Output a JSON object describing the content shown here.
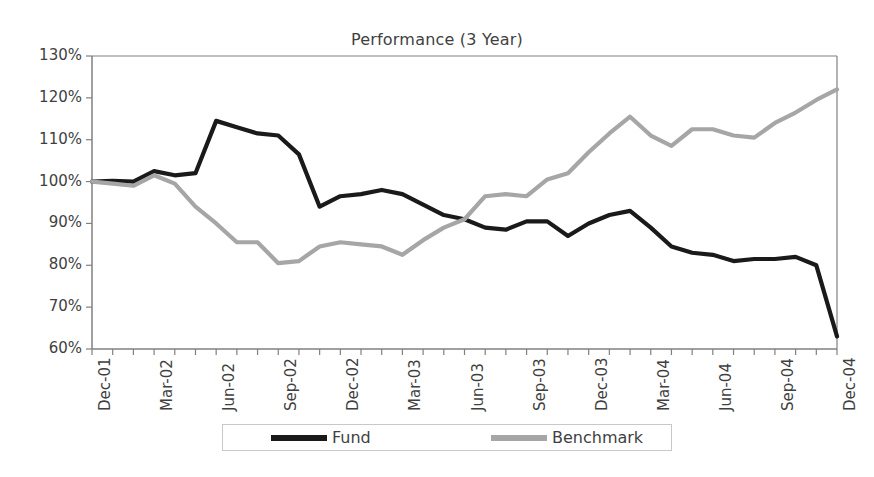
{
  "chart_data": {
    "type": "line",
    "title": "Performance (3 Year)",
    "xlabel": "",
    "ylabel": "",
    "ylim": [
      60,
      130
    ],
    "ytick_labels": [
      "130%",
      "120%",
      "110%",
      "100%",
      "90%",
      "80%",
      "70%",
      "60%"
    ],
    "ytick_values": [
      130,
      120,
      110,
      100,
      90,
      80,
      70,
      60
    ],
    "grid": false,
    "legend_position": "bottom",
    "x": [
      "Dec-01",
      "Jan-02",
      "Feb-02",
      "Mar-02",
      "Apr-02",
      "May-02",
      "Jun-02",
      "Jul-02",
      "Aug-02",
      "Sep-02",
      "Oct-02",
      "Nov-02",
      "Dec-02",
      "Jan-03",
      "Feb-03",
      "Mar-03",
      "Apr-03",
      "May-03",
      "Jun-03",
      "Jul-03",
      "Aug-03",
      "Sep-03",
      "Oct-03",
      "Nov-03",
      "Dec-03",
      "Jan-04",
      "Feb-04",
      "Mar-04",
      "Apr-04",
      "May-04",
      "Jun-04",
      "Jul-04",
      "Aug-04",
      "Sep-04",
      "Oct-04",
      "Nov-04",
      "Dec-04"
    ],
    "xtick_labels": [
      "Dec-01",
      "Mar-02",
      "Jun-02",
      "Sep-02",
      "Dec-02",
      "Mar-03",
      "Jun-03",
      "Sep-03",
      "Dec-03",
      "Mar-04",
      "Jun-04",
      "Sep-04",
      "Dec-04"
    ],
    "series": [
      {
        "name": "Fund",
        "color": "#1a1a1a",
        "values": [
          100.0,
          100.2,
          100.0,
          102.5,
          101.5,
          102.0,
          114.5,
          113.0,
          111.5,
          111.0,
          106.5,
          94.0,
          96.5,
          97.0,
          98.0,
          97.0,
          94.5,
          92.0,
          91.0,
          89.0,
          88.5,
          90.5,
          90.5,
          87.0,
          90.0,
          92.0,
          93.0,
          89.0,
          84.5,
          83.0,
          82.5,
          81.0,
          81.5,
          81.5,
          82.0,
          80.0,
          63.0
        ]
      },
      {
        "name": "Benchmark",
        "color": "#a6a6a6",
        "values": [
          100.0,
          99.5,
          99.0,
          101.5,
          99.5,
          94.0,
          90.0,
          85.5,
          85.5,
          80.5,
          81.0,
          84.5,
          85.5,
          85.0,
          84.5,
          82.5,
          86.0,
          89.0,
          91.0,
          96.5,
          97.0,
          96.5,
          100.5,
          102.0,
          107.0,
          111.5,
          115.5,
          111.0,
          108.5,
          112.5,
          112.5,
          111.0,
          110.5,
          114.0,
          116.5,
          119.5,
          122.0
        ]
      }
    ]
  },
  "legend": {
    "entries": [
      {
        "label": "Fund"
      },
      {
        "label": "Benchmark"
      }
    ]
  },
  "colors": {
    "fund": "#1a1a1a",
    "benchmark": "#a6a6a6",
    "axis": "#808080",
    "text": "#3f3f3f"
  }
}
